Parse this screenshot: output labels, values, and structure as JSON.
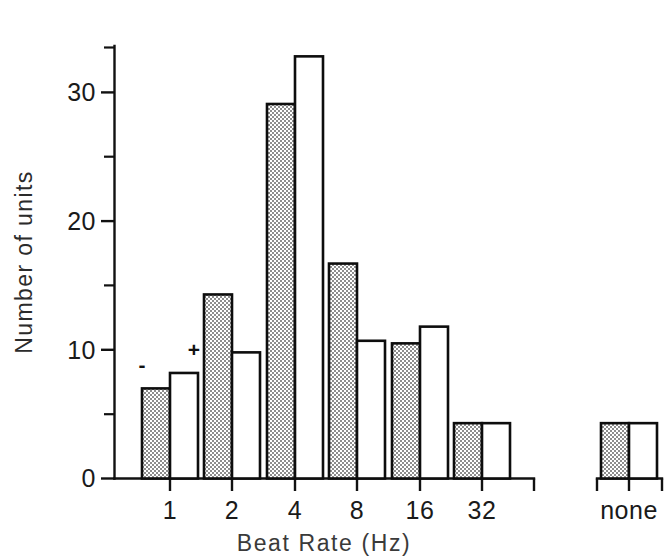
{
  "chart_data": {
    "type": "bar",
    "title": "",
    "subtitle": "",
    "xlabel": "Beat Rate (Hz)",
    "ylabel": "Number of units",
    "categories": [
      "1",
      "2",
      "4",
      "8",
      "16",
      "32",
      "none"
    ],
    "series": [
      {
        "name": "-",
        "style": "shaded",
        "values": [
          7.0,
          14.3,
          29.1,
          16.7,
          10.5,
          4.3,
          4.3
        ]
      },
      {
        "name": "+",
        "style": "white",
        "values": [
          8.2,
          9.8,
          32.8,
          10.7,
          11.8,
          4.3,
          4.3
        ]
      }
    ],
    "ylim": [
      0,
      35
    ],
    "y_major_ticks": [
      0,
      10,
      20,
      30
    ],
    "y_major_tick_labels": [
      "0",
      "10",
      "20",
      "30"
    ],
    "y_minor_ticks": [
      5,
      15,
      25,
      35
    ],
    "grid": false,
    "legend_position": "in-plot-annotation",
    "annotations": [
      {
        "text": "-",
        "category": "1",
        "series": "-",
        "note": "minus sign above first shaded bar"
      },
      {
        "text": "+",
        "category": "1",
        "series": "+",
        "note": "plus sign above first white bar"
      }
    ],
    "colors": {
      "axis": "#111111",
      "bar_outline": "#0d0d0d",
      "bar_shaded_fill": "#b8b8b8",
      "bar_white_fill": "#ffffff",
      "text": "#1a1a1a",
      "background": "#ffffff"
    }
  },
  "figure": {
    "y_axis_title": "Number of units",
    "x_axis_title": "Beat Rate (Hz)",
    "y_tick_labels": [
      "30",
      "20",
      "10",
      "0"
    ],
    "x_tick_labels": [
      "1",
      "2",
      "4",
      "8",
      "16",
      "32",
      "none"
    ],
    "series_marks": {
      "shaded": "-",
      "white": "+"
    }
  }
}
